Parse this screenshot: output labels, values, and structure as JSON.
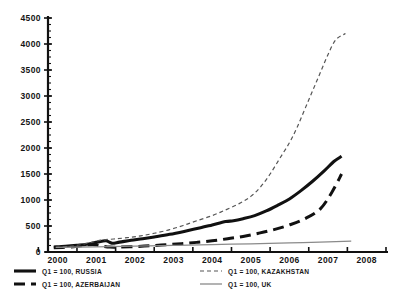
{
  "chart_data": {
    "type": "line",
    "title": "",
    "subtitle": "",
    "xlabel": "",
    "ylabel": "",
    "xlim": [
      1999.75,
      2008.5
    ],
    "ylim": [
      0,
      4500
    ],
    "grid": false,
    "legend_position": "bottom",
    "y_ticks": [
      0,
      500,
      1000,
      1500,
      2000,
      2500,
      3000,
      3500,
      4000,
      4500
    ],
    "y_tick_labels": [
      "0",
      "500",
      "1000",
      "1500",
      "2000",
      "2500",
      "3000",
      "3500",
      "4000",
      "4500"
    ],
    "y_minor_step": 125,
    "x_ticks": [
      2000,
      2001,
      2002,
      2003,
      2004,
      2005,
      2006,
      2007,
      2008
    ],
    "x_tick_labels": [
      "2000",
      "2001",
      "2002",
      "2003",
      "2004",
      "2005",
      "2006",
      "2007",
      "2008"
    ],
    "series": [
      {
        "name": "Q1 = 100, RUSSIA",
        "style": "thick-solid",
        "color": "#111111",
        "width": 3.1,
        "dash": "",
        "x": [
          1999.9,
          2000.2,
          2000.5,
          2000.75,
          2001.0,
          2001.25,
          2001.4,
          2001.6,
          2001.9,
          2002.2,
          2002.5,
          2002.9,
          2003.3,
          2003.7,
          2004.0,
          2004.35,
          2004.55,
          2004.8,
          2005.1,
          2005.4,
          2005.7,
          2006.0,
          2006.3,
          2006.6,
          2006.9,
          2007.15,
          2007.35
        ],
        "y": [
          95,
          110,
          130,
          150,
          185,
          215,
          170,
          190,
          225,
          255,
          290,
          340,
          400,
          465,
          520,
          585,
          600,
          640,
          700,
          790,
          900,
          1020,
          1180,
          1360,
          1560,
          1740,
          1840
        ]
      },
      {
        "name": "Q1 = 100, AZERBAIJAN",
        "style": "thick-dashed",
        "color": "#111111",
        "width": 3.0,
        "dash": "11 6",
        "x": [
          1999.9,
          2000.3,
          2000.6,
          2000.9,
          2001.1,
          2001.35,
          2001.6,
          2002.0,
          2002.4,
          2002.8,
          2003.2,
          2003.6,
          2004.0,
          2004.4,
          2004.8,
          2005.2,
          2005.6,
          2006.0,
          2006.4,
          2006.8,
          2007.1,
          2007.35
        ],
        "y": [
          80,
          95,
          120,
          145,
          120,
          95,
          95,
          105,
          120,
          140,
          160,
          185,
          215,
          255,
          300,
          360,
          430,
          520,
          640,
          830,
          1150,
          1500
        ]
      },
      {
        "name": "Q1 = 100, KAZAKHSTAN",
        "style": "thin-dashed",
        "color": "#555555",
        "width": 1.2,
        "dash": "4 3",
        "x": [
          1999.95,
          2000.3,
          2000.6,
          2000.9,
          2001.15,
          2001.45,
          2001.8,
          2002.15,
          2002.5,
          2002.9,
          2003.25,
          2003.6,
          2004.0,
          2004.35,
          2004.7,
          2005.0,
          2005.25,
          2005.5,
          2005.75,
          2006.0,
          2006.2,
          2006.4,
          2006.6,
          2006.8,
          2007.0,
          2007.2,
          2007.45
        ],
        "y": [
          90,
          110,
          140,
          190,
          230,
          250,
          275,
          310,
          360,
          430,
          510,
          600,
          700,
          810,
          930,
          1070,
          1250,
          1500,
          1800,
          2100,
          2400,
          2750,
          3100,
          3450,
          3800,
          4080,
          4200
        ]
      },
      {
        "name": "Q1 = 100, UK",
        "style": "thin-solid",
        "color": "#8a8a8a",
        "width": 1.3,
        "dash": "",
        "x": [
          1999.95,
          2001.0,
          2002.0,
          2003.0,
          2004.0,
          2005.0,
          2006.0,
          2007.0,
          2007.6
        ],
        "y": [
          90,
          100,
          112,
          126,
          142,
          158,
          175,
          195,
          210
        ]
      }
    ]
  },
  "legend": {
    "left_entries": [
      {
        "label": "Q1 = 100, RUSSIA",
        "style": "thick-solid"
      },
      {
        "label": "Q1 = 100, AZERBAIJAN",
        "style": "thick-dashed"
      }
    ],
    "right_entries": [
      {
        "label": "Q1 = 100, KAZAKHSTAN",
        "style": "thin-dashed"
      },
      {
        "label": "Q1 = 100, UK",
        "style": "thin-solid"
      }
    ]
  }
}
